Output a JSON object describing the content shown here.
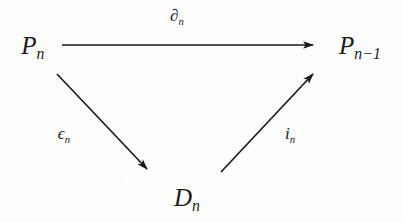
{
  "diagram": {
    "kind": "commutative-triangle",
    "background_color": "#fdfdfc",
    "ink_color": "#1b1b1b",
    "nodes": [
      {
        "id": "p-n",
        "base": "P",
        "sub": "n",
        "x": 33,
        "y": 45
      },
      {
        "id": "p-n-minus-1",
        "base": "P",
        "sub": "n−1",
        "x": 360,
        "y": 45
      },
      {
        "id": "d-n",
        "base": "D",
        "sub": "n",
        "x": 187,
        "y": 197
      }
    ],
    "arrows": [
      {
        "id": "boundary-map",
        "from": "p-n",
        "to": "p-n-minus-1",
        "label_base": "∂",
        "label_sub": "n",
        "label_x": 177,
        "label_y": 15,
        "x1": 62,
        "y1": 45,
        "x2": 313,
        "y2": 45
      },
      {
        "id": "epsilon-map",
        "from": "p-n",
        "to": "d-n",
        "label_base": "ϵ",
        "label_sub": "n",
        "label_x": 64,
        "label_y": 133,
        "x1": 57,
        "y1": 74,
        "x2": 147,
        "y2": 169
      },
      {
        "id": "inclusion-map",
        "from": "d-n",
        "to": "p-n-minus-1",
        "label_base": "i",
        "label_sub": "n",
        "label_x": 290,
        "label_y": 133,
        "x1": 221,
        "y1": 172,
        "x2": 313,
        "y2": 74
      }
    ]
  }
}
